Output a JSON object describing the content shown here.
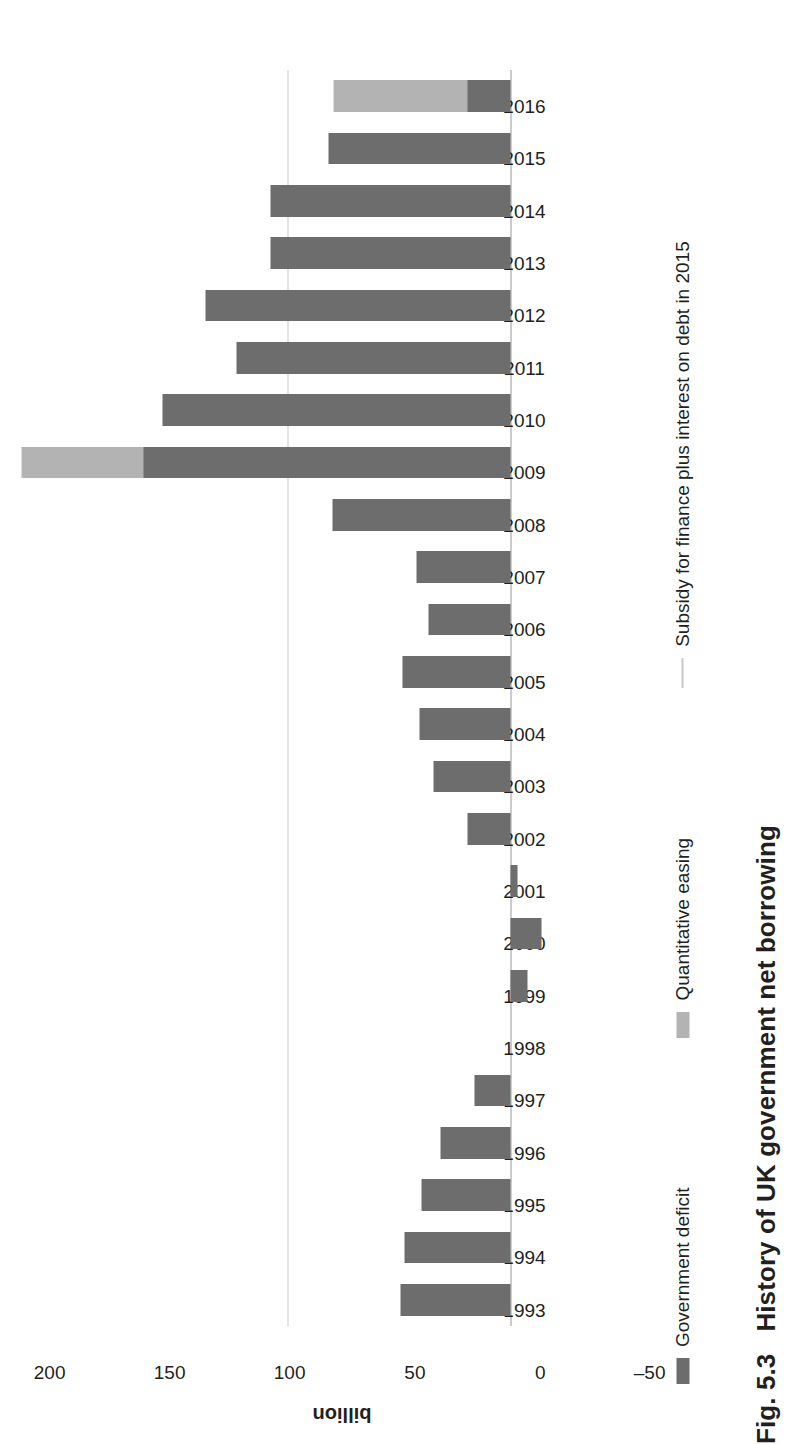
{
  "figure": {
    "number": "Fig. 5.3",
    "caption": "History of UK government net borrowing"
  },
  "legend": {
    "items": [
      {
        "label": "Government deficit",
        "marker": "swatch",
        "color": "#6d6d6d"
      },
      {
        "label": "Quantitative easing",
        "marker": "swatch",
        "color": "#b3b3b3"
      },
      {
        "label": "Subsidy for finance plus interest on debt in 2015",
        "marker": "line",
        "color": "#c9c9c9"
      }
    ]
  },
  "axes": {
    "value_label": "billion",
    "value_ticks": [
      "200",
      "150",
      "100",
      "50",
      "0",
      "–50"
    ],
    "value_tick_values": [
      200,
      150,
      100,
      50,
      0,
      -50
    ],
    "value_min": -50,
    "value_max": 200
  },
  "chart_data": {
    "type": "bar",
    "title": "History of UK government net borrowing",
    "xlabel": "",
    "ylabel": "billion",
    "ylim": [
      -50,
      200
    ],
    "grid": false,
    "orientation": "horizontal-rotated",
    "legend_position": "bottom",
    "categories": [
      "1993",
      "1994",
      "1995",
      "1996",
      "1997",
      "1998",
      "1999",
      "2000",
      "2001",
      "2002",
      "2003",
      "2004",
      "2005",
      "2006",
      "2007",
      "2008",
      "2009",
      "2010",
      "2011",
      "2012",
      "2013",
      "2014",
      "2015",
      "2016"
    ],
    "series": [
      {
        "name": "Government deficit",
        "color": "#6d6d6d",
        "values": [
          46,
          44,
          37,
          29,
          15,
          0,
          -7,
          -13,
          -3,
          18,
          32,
          38,
          45,
          34,
          39,
          74,
          153,
          145,
          114,
          127,
          100,
          100,
          76,
          18
        ]
      },
      {
        "name": "Quantitative easing",
        "color": "#b3b3b3",
        "values": [
          0,
          0,
          0,
          0,
          0,
          0,
          0,
          0,
          0,
          0,
          0,
          0,
          0,
          0,
          0,
          0,
          200,
          0,
          65,
          100,
          0,
          0,
          0,
          70
        ]
      }
    ],
    "annotations": [
      {
        "name": "Subsidy for finance plus interest on debt in 2015",
        "type": "reference-line",
        "value": 93,
        "color": "#c9c9c9"
      }
    ]
  }
}
